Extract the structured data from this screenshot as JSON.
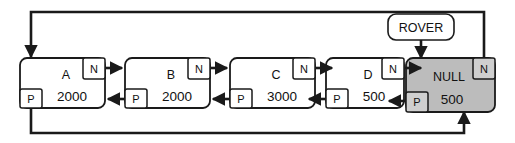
{
  "diagram": {
    "colors": {
      "stroke": "#1a1a1a",
      "node_fill": "#ffffff",
      "null_fill": "#bcbcbc",
      "null_slot_fill": "#cfcfcf",
      "text": "#111111"
    },
    "pointer": {
      "label": "ROVER"
    },
    "slots": {
      "next_label": "N",
      "prev_label": "P"
    },
    "nodes": [
      {
        "name": "A",
        "value": "2000",
        "next_label": "N",
        "prev_label": "P",
        "highlighted": "false"
      },
      {
        "name": "B",
        "value": "2000",
        "next_label": "N",
        "prev_label": "P",
        "highlighted": "false"
      },
      {
        "name": "C",
        "value": "3000",
        "next_label": "N",
        "prev_label": "P",
        "highlighted": "false"
      },
      {
        "name": "D",
        "value": "500",
        "next_label": "N",
        "prev_label": "P",
        "highlighted": "false"
      },
      {
        "name": "NULL",
        "value": "500",
        "next_label": "N",
        "prev_label": "P",
        "highlighted": "true"
      }
    ]
  }
}
